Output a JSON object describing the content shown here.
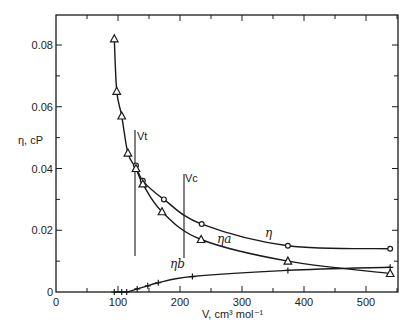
{
  "chart_data": {
    "type": "line",
    "title": "",
    "xlabel": "V, cm³ mol⁻¹",
    "ylabel": "η, cP",
    "xlim": [
      0,
      550
    ],
    "ylim": [
      0,
      0.09
    ],
    "x_ticks": [
      "0",
      "100",
      "200",
      "300",
      "400",
      "500"
    ],
    "y_ticks": [
      "0",
      "0.02",
      "0.04",
      "0.06",
      "0.08"
    ],
    "grid": false,
    "legend": "none (inline curve labels)",
    "series": [
      {
        "name": "η",
        "marker": "circle",
        "x": [
          129,
          140,
          174,
          235,
          374,
          539
        ],
        "y": [
          0.041,
          0.036,
          0.03,
          0.022,
          0.015,
          0.014
        ]
      },
      {
        "name": "ηa",
        "marker": "triangle",
        "x": [
          94,
          98,
          106,
          116,
          129,
          140,
          171,
          234,
          374,
          539
        ],
        "y": [
          0.082,
          0.065,
          0.057,
          0.045,
          0.04,
          0.035,
          0.026,
          0.017,
          0.01,
          0.006
        ]
      },
      {
        "name": "ηb",
        "marker": "plus",
        "x": [
          94,
          106,
          114,
          131,
          148,
          165,
          220,
          374,
          539
        ],
        "y": [
          0.0,
          0.0,
          0.0,
          0.001,
          0.002,
          0.003,
          0.005,
          0.007,
          0.008
        ]
      }
    ],
    "annotations": [
      {
        "label": "Vt",
        "type": "vertical-line",
        "x": 127
      },
      {
        "label": "Vc",
        "type": "vertical-line",
        "x": 206
      }
    ]
  },
  "labels": {
    "y_axis": "η, cP",
    "x_axis": "V, cm³ mol⁻¹",
    "vt": "Vt",
    "vc": "Vc",
    "eta": "η",
    "eta_a": "ηa",
    "eta_b": "ηb"
  }
}
